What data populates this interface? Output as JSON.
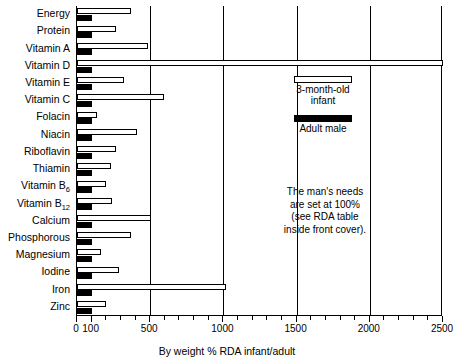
{
  "chart_data": {
    "type": "bar",
    "orientation": "horizontal",
    "title": "",
    "xlabel": "By weight % RDA infant/adult",
    "ylabel": "",
    "xlim": [
      0,
      2500
    ],
    "xticks": [
      0,
      100,
      200,
      300,
      400,
      500,
      600,
      700,
      800,
      900,
      1000,
      1100,
      1200,
      1300,
      1400,
      1500,
      1600,
      1700,
      1800,
      1900,
      2000,
      2100,
      2200,
      2300,
      2400,
      2500
    ],
    "xtick_labels": [
      {
        "value": 0,
        "label": "0"
      },
      {
        "value": 100,
        "label": "100"
      },
      {
        "value": 500,
        "label": "500"
      },
      {
        "value": 1000,
        "label": "1000"
      },
      {
        "value": 1500,
        "label": "1500"
      },
      {
        "value": 2000,
        "label": "2000"
      },
      {
        "value": 2500,
        "label": "2500"
      }
    ],
    "gridlines": [
      500,
      1000,
      1500,
      2000
    ],
    "grid": true,
    "legend_position": "inside-right-top",
    "categories": [
      "Energy",
      "Protein",
      "Vitamin A",
      "Vitamin D",
      "Vitamin E",
      "Vitamin C",
      "Folacin",
      "Niacin",
      "Riboflavin",
      "Thiamin",
      "Vitamin B6",
      "Vitamin B12",
      "Calcium",
      "Phosphorous",
      "Magnesium",
      "Iodine",
      "Iron",
      "Zinc"
    ],
    "category_labels_html": [
      "Energy",
      "Protein",
      "Vitamin A",
      "Vitamin D",
      "Vitamin E",
      "Vitamin C",
      "Folacin",
      "Niacin",
      "Riboflavin",
      "Thiamin",
      "Vitamin B<sub>6</sub>",
      "Vitamin B<sub>12</sub>",
      "Calcium",
      "Phosphorous",
      "Magnesium",
      "Iodine",
      "Iron",
      "Zinc"
    ],
    "series": [
      {
        "name": "3-month-old infant",
        "color": "#ffffff",
        "edgecolor": "#000000",
        "values": [
          370,
          265,
          485,
          2500,
          320,
          595,
          135,
          410,
          265,
          230,
          200,
          240,
          505,
          370,
          165,
          290,
          1015,
          195
        ]
      },
      {
        "name": "Adult male",
        "color": "#000000",
        "edgecolor": "#000000",
        "values": [
          100,
          100,
          100,
          100,
          100,
          100,
          100,
          100,
          100,
          100,
          100,
          100,
          100,
          100,
          100,
          100,
          100,
          100
        ]
      }
    ],
    "annotations": [
      "The man's needs",
      "are set at 100%",
      "(see RDA table",
      "inside front cover)."
    ]
  },
  "legend": {
    "entries": [
      {
        "label_line1": "3-month-old",
        "label_line2": "infant",
        "style": "open"
      },
      {
        "label_line1": "Adult male",
        "label_line2": "",
        "style": "filled"
      }
    ]
  }
}
